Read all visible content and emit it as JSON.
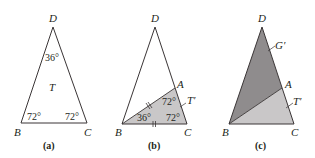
{
  "figure": {
    "colors": {
      "stroke": "#3a3536",
      "light_fill": "#c9c7c8",
      "dark_fill": "#8f8c8d",
      "background": "#ffffff"
    },
    "panels": [
      {
        "caption": "(a)",
        "vertices": {
          "D": "D",
          "B": "B",
          "C": "C"
        },
        "angles": {
          "apex": "36°",
          "left": "72°",
          "right": "72°"
        },
        "region_label": "T"
      },
      {
        "caption": "(b)",
        "vertices": {
          "D": "D",
          "A": "A",
          "B": "B",
          "C": "C"
        },
        "angles": {
          "top": "72°",
          "left": "36°",
          "right": "72°"
        },
        "region_label": "T′"
      },
      {
        "caption": "(c)",
        "vertices": {
          "D": "D",
          "A": "A",
          "B": "B",
          "C": "C"
        },
        "region_labels": {
          "upper": "G′",
          "lower": "T′"
        }
      }
    ]
  }
}
